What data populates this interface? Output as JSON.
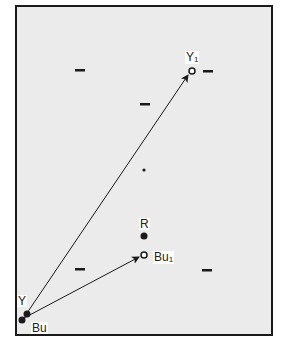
{
  "diagram": {
    "frame": {
      "x": 15,
      "y": 5,
      "width": 258,
      "height": 331,
      "fill": "#ebebeb",
      "stroke": "#1a1a1a"
    },
    "colors": {
      "ink": "#1a1a1a",
      "background": "#ebebeb",
      "label_bg": "#ffffff"
    },
    "points": {
      "Y": {
        "label": "Y",
        "subscript": "",
        "x": 27,
        "y": 313,
        "style": "filled"
      },
      "Bu": {
        "label": "Bu",
        "subscript": "",
        "x": 22,
        "y": 320,
        "style": "filled"
      },
      "Y1": {
        "label": "Y",
        "subscript": "1",
        "x": 192,
        "y": 71,
        "style": "open"
      },
      "R": {
        "label": "R",
        "subscript": "",
        "x": 144,
        "y": 236,
        "style": "filled"
      },
      "Bu1": {
        "label": "Bu",
        "subscript": "1",
        "x": 144,
        "y": 255,
        "style": "open"
      },
      "center": {
        "label": "",
        "x": 144,
        "y": 170,
        "style": "small-dot"
      }
    },
    "arrows": [
      {
        "from": "Y",
        "to": "Y1",
        "name": "arrow-y-to-y1"
      },
      {
        "from": "Bu",
        "to": "Bu1",
        "name": "arrow-bu-to-bu1"
      }
    ],
    "dashes": [
      {
        "x": 75,
        "y": 70
      },
      {
        "x": 203,
        "y": 71
      },
      {
        "x": 140,
        "y": 104
      },
      {
        "x": 75,
        "y": 269
      },
      {
        "x": 202,
        "y": 270
      }
    ],
    "labels": {
      "Y1_main": "Y",
      "Y1_sub": "1",
      "R": "R",
      "Bu1_main": "Bu",
      "Bu1_sub": "1",
      "Y": "Y",
      "Bu": "Bu"
    }
  }
}
